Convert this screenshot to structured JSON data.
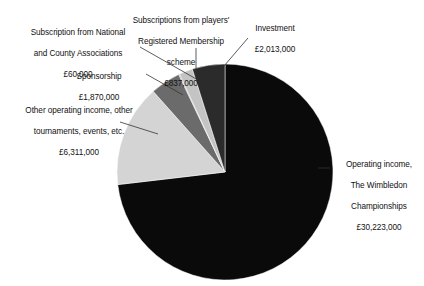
{
  "chart_data": {
    "type": "pie",
    "title": "",
    "currency": "£",
    "total": 41314000,
    "units": "GBP",
    "legend_position": "callout-labels",
    "grid": false,
    "categories": [
      "Operating income, The Wimbledon Championships",
      "Other operating income, other tournaments, events, etc.",
      "Sponsorship",
      "Subscription from National and County Associations",
      "Subscriptions from players' Registered Membership scheme",
      "Investment"
    ],
    "values": [
      30223000,
      6311000,
      1870000,
      60000,
      837000,
      2013000
    ],
    "value_labels": [
      "£30,223,000",
      "£6,311,000",
      "£1,870,000",
      "£60,000",
      "£837,000",
      "£2,013,000"
    ],
    "slices": [
      {
        "name": "operating-income-wimbledon",
        "label": "Operating income,\nThe Wimbledon\nChampionships",
        "value_label": "£30,223,000",
        "value": 30223000,
        "percent": 73.2,
        "color": "#0a0a0a",
        "start_angle": 0.0,
        "end_angle": 263.3
      },
      {
        "name": "other-operating-income",
        "label": "Other operating income, other\ntournaments, events, etc.",
        "value_label": "£6,311,000",
        "value": 6311000,
        "percent": 15.3,
        "color": "#d4d4d4",
        "start_angle": 263.3,
        "end_angle": 318.3
      },
      {
        "name": "sponsorship",
        "label": "Sponsorship",
        "value_label": "£1,870,000",
        "value": 1870000,
        "percent": 4.5,
        "color": "#6b6b6b",
        "start_angle": 318.3,
        "end_angle": 334.6
      },
      {
        "name": "subscription-national-county",
        "label": "Subscription from National\nand County Associations",
        "value_label": "£60,000",
        "value": 60000,
        "percent": 0.15,
        "color": "#8f8f8f",
        "start_angle": 334.6,
        "end_angle": 335.1
      },
      {
        "name": "subscriptions-players-membership",
        "label": "Subscriptions from players'\nRegistered Membership\nscheme",
        "value_label": "£837,000",
        "value": 837000,
        "percent": 2.0,
        "color": "#c4c4c4",
        "start_angle": 335.1,
        "end_angle": 342.4
      },
      {
        "name": "investment",
        "label": "Investment",
        "value_label": "£2,013,000",
        "value": 2013000,
        "percent": 4.9,
        "color": "#2b2b2b",
        "start_angle": 342.4,
        "end_angle": 360.0
      }
    ],
    "labels": {
      "operating": {
        "line1": "Operating income,",
        "line2": "The Wimbledon",
        "line3": "Championships",
        "value": "£30,223,000"
      },
      "other": {
        "line1": "Other operating income, other",
        "line2": "tournaments, events, etc.",
        "value": "£6,311,000"
      },
      "sponsorship": {
        "line1": "Sponsorship",
        "value": "£1,870,000"
      },
      "national": {
        "line1": "Subscription from National",
        "line2": "and County Associations",
        "value": "£60,000"
      },
      "players": {
        "line1": "Subscriptions from players'",
        "line2": "Registered Membership",
        "line3": "scheme",
        "value": "£837,000"
      },
      "investment": {
        "line1": "Investment",
        "value": "£2,013,000"
      }
    }
  },
  "figure": {
    "background": "#ffffff",
    "leader_line_color": "#333333",
    "center_x": 225,
    "center_y": 172,
    "radius": 108
  }
}
